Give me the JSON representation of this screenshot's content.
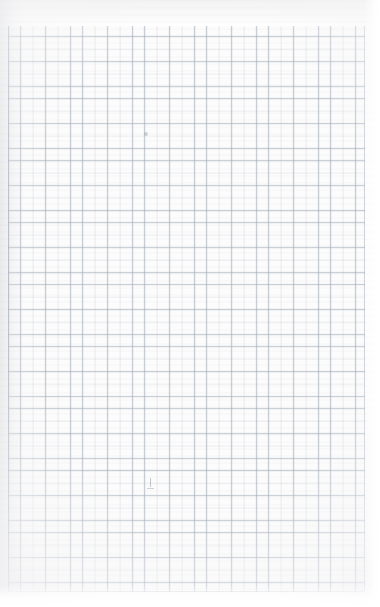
{
  "document": {
    "kind": "scanned-graph-paper",
    "description": "Scanned sheet of blank quadrille / graph paper",
    "orientation": "portrait",
    "width_px": 380,
    "height_px": 607,
    "text_content": "",
    "is_blank": true
  },
  "paper": {
    "background_color": "#fdfdfd",
    "grid_field_color": "#fcfcfc",
    "page_edge_color": "#ffffff",
    "top_cast_color": "#f2f2f3"
  },
  "grid": {
    "line_color": "#96a0af",
    "line_color_soft": "#a5acb9",
    "cell_size_px": 12.4,
    "line_width_px": 0.7,
    "columns": 29,
    "rows": 46,
    "left_px": 8,
    "top_px": 24,
    "right_px": 365,
    "bottom_px": 592,
    "field_width_px": 357,
    "field_height_px": 568,
    "has_major_lines": false,
    "style": "uniform-quadrille"
  },
  "margins": {
    "left_px": 8,
    "top_px": 24,
    "right_px": 15,
    "bottom_px": 15
  },
  "scan_artifacts": {
    "gutter_shadow_side": "left",
    "gutter_shadow_width_px": 26,
    "gutter_shadow_color": "#afb2b9",
    "banding": "horizontal",
    "vignette": "soft-edge-falloff"
  },
  "marks": [
    {
      "name": "pencil-mark-center",
      "x_px": 150,
      "y_px": 483,
      "color": "#787d87",
      "note": "faint short pencil tick near lower center"
    },
    {
      "name": "pencil-mark-upper",
      "x_px": 146,
      "y_px": 134,
      "color": "#8d939e",
      "note": "faint darker grid intersection in upper area"
    }
  ]
}
